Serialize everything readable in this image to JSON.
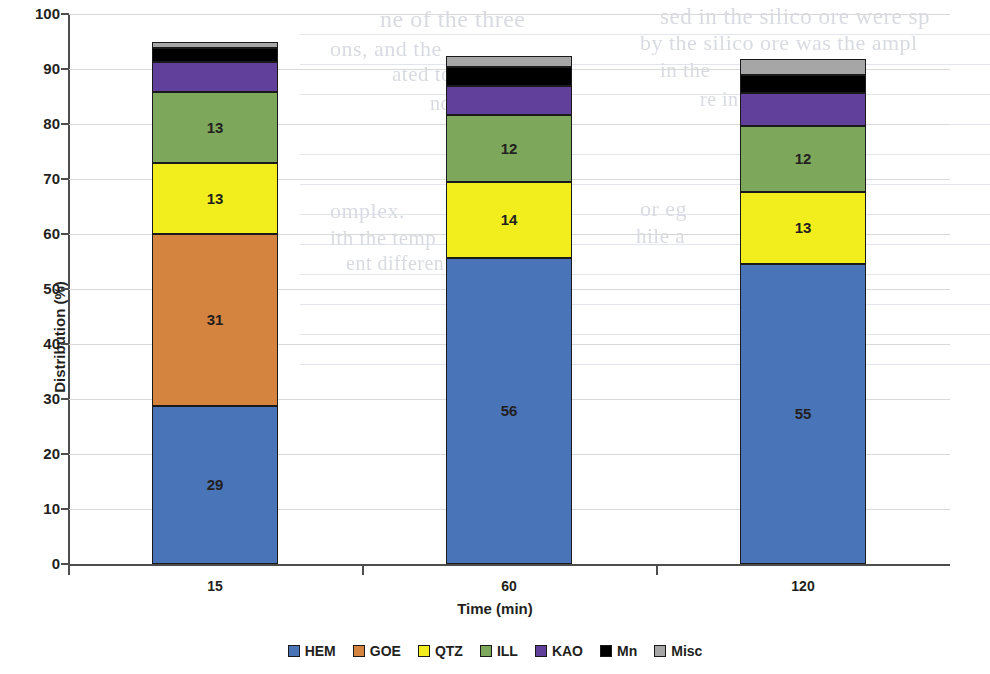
{
  "chart_data": {
    "type": "bar",
    "subtype": "stacked-column",
    "title": "",
    "xlabel": "Time (min)",
    "ylabel": "Distribution (%)",
    "categories": [
      "15",
      "60",
      "120"
    ],
    "ylim": [
      0,
      100
    ],
    "yticks": [
      "0",
      "10",
      "20",
      "30",
      "40",
      "50",
      "60",
      "70",
      "80",
      "90",
      "100"
    ],
    "grid": true,
    "legend_position": "bottom",
    "series": [
      {
        "name": "HEM",
        "color": "#4a74b8",
        "values": [
          28.8,
          55.7,
          54.6
        ],
        "labels": [
          "29",
          "56",
          "55"
        ]
      },
      {
        "name": "GOE",
        "color": "#d4843f",
        "values": [
          31.2,
          0,
          0
        ],
        "labels": [
          "31",
          "",
          ""
        ]
      },
      {
        "name": "QTZ",
        "color": "#f2ed1c",
        "values": [
          13.0,
          13.7,
          13.1
        ],
        "labels": [
          "13",
          "14",
          "13"
        ]
      },
      {
        "name": "ILL",
        "color": "#7da85c",
        "values": [
          12.8,
          12.2,
          12.0
        ],
        "labels": [
          "13",
          "12",
          "12"
        ]
      },
      {
        "name": "KAO",
        "color": "#61409b",
        "values": [
          5.5,
          5.3,
          5.9
        ],
        "labels": [
          "",
          "",
          ""
        ]
      },
      {
        "name": "Mn",
        "color": "#000000",
        "values": [
          2.5,
          3.5,
          3.3
        ],
        "labels": [
          "",
          "",
          ""
        ]
      },
      {
        "name": "Misc",
        "color": "#a6a6a6",
        "values": [
          1.2,
          2.0,
          2.9
        ],
        "labels": [
          "",
          "",
          ""
        ]
      }
    ],
    "totals": [
      95.0,
      92.4,
      91.8
    ]
  },
  "axes": {
    "y_title": "Distribution (%)",
    "x_title": "Time (min)"
  },
  "background_notes": {
    "bleed_lines": [
      "ne of the three",
      "ons, and the",
      "ated to the",
      "nd",
      "sed in the silico ore were sp",
      "by the silico ore was  the ampl",
      "in the",
      "re in more",
      "omplex.",
      "ith the temp",
      "ent differen",
      "or eg",
      "hile a"
    ]
  }
}
